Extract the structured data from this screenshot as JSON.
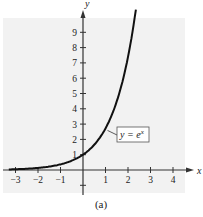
{
  "chart_data": {
    "type": "line",
    "title": "",
    "caption": "(a)",
    "xlabel": "x",
    "ylabel": "y",
    "xlim": [
      -3.3,
      4.6
    ],
    "ylim": [
      -1.3,
      10.2
    ],
    "x_ticks": [
      -3,
      -2,
      -1,
      1,
      2,
      3,
      4
    ],
    "x_tick_labels": [
      "−3",
      "−2",
      "−1",
      "1",
      "2",
      "3",
      "4"
    ],
    "y_ticks": [
      1,
      2,
      3,
      4,
      5,
      6,
      7,
      8,
      9
    ],
    "y_tick_labels": [
      "1",
      "2",
      "3",
      "4",
      "5",
      "6",
      "7",
      "8",
      "9"
    ],
    "grid": false,
    "background": "#f2f2f2",
    "series": [
      {
        "name": "y = e^x",
        "function": "exp(x)",
        "color": "#111111",
        "x": [
          -3.3,
          -3,
          -2.5,
          -2,
          -1.5,
          -1,
          -0.5,
          0,
          0.5,
          1,
          1.5,
          2,
          2.2,
          2.35
        ],
        "y": [
          0.037,
          0.05,
          0.082,
          0.135,
          0.223,
          0.368,
          0.607,
          1,
          1.649,
          2.718,
          4.482,
          7.389,
          9.025,
          10.486
        ]
      }
    ],
    "annotations": [
      {
        "text": "y = e",
        "superscript": "x",
        "boxed": true,
        "anchor_x": 1,
        "anchor_y": 2.718
      }
    ]
  }
}
